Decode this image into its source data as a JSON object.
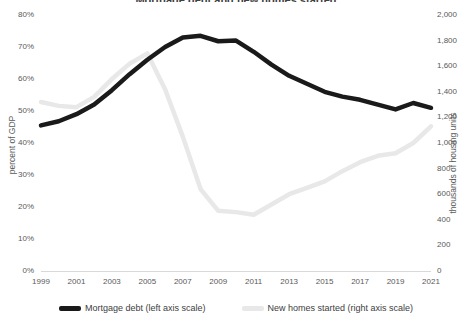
{
  "chart_data": {
    "type": "line",
    "title": "Mortgage debt and new homes started",
    "x": [
      1999,
      2000,
      2001,
      2002,
      2003,
      2004,
      2005,
      2006,
      2007,
      2008,
      2009,
      2010,
      2011,
      2012,
      2013,
      2014,
      2015,
      2016,
      2017,
      2018,
      2019,
      2020,
      2021
    ],
    "xlabel": "",
    "tick_labels_x": [
      "1999",
      "2001",
      "2003",
      "2005",
      "2007",
      "2009",
      "2011",
      "2013",
      "2015",
      "2017",
      "2019",
      "2021"
    ],
    "tick_values_x": [
      1999,
      2001,
      2003,
      2005,
      2007,
      2009,
      2011,
      2013,
      2015,
      2017,
      2019,
      2021
    ],
    "grid": false,
    "legend_position": "bottom",
    "axes": [
      {
        "id": "left",
        "label": "percent of GDP",
        "ylim": [
          0,
          80
        ],
        "tick_labels": [
          "0%",
          "10%",
          "20%",
          "30%",
          "40%",
          "50%",
          "60%",
          "70%",
          "80%"
        ],
        "tick_values": [
          0,
          10,
          20,
          30,
          40,
          50,
          60,
          70,
          80
        ]
      },
      {
        "id": "right",
        "label": "thousands of housing units",
        "ylim": [
          0,
          2000
        ],
        "tick_labels": [
          "0",
          "200",
          "400",
          "600",
          "800",
          "1,000",
          "1,200",
          "1,400",
          "1,600",
          "1,800",
          "2,000"
        ],
        "tick_values": [
          0,
          200,
          400,
          600,
          800,
          1000,
          1200,
          1400,
          1600,
          1800,
          2000
        ]
      }
    ],
    "series": [
      {
        "name": "Mortgage debt (left axis scale)",
        "axis": "left",
        "color": "#1a1a1a",
        "unit": "percent of GDP",
        "values": [
          45.5,
          46.8,
          49.0,
          52.0,
          56.5,
          61.5,
          66.0,
          70.0,
          73.0,
          73.5,
          71.8,
          72.0,
          68.5,
          64.5,
          61.0,
          58.5,
          56.0,
          54.5,
          53.5,
          52.0,
          50.5,
          52.5,
          51.0
        ]
      },
      {
        "name": "New homes started (right axis scale)",
        "axis": "right",
        "color": "#e8e8e8",
        "unit": "thousands of housing units",
        "values": [
          1320,
          1290,
          1280,
          1360,
          1500,
          1620,
          1700,
          1420,
          1050,
          640,
          470,
          460,
          440,
          520,
          600,
          650,
          700,
          780,
          850,
          900,
          920,
          1000,
          1130
        ]
      }
    ]
  },
  "legend": {
    "entries": [
      {
        "label": "Mortgage debt (left axis scale)",
        "color": "#1a1a1a"
      },
      {
        "label": "New homes started (right axis scale)",
        "color": "#e8e8e8"
      }
    ]
  }
}
